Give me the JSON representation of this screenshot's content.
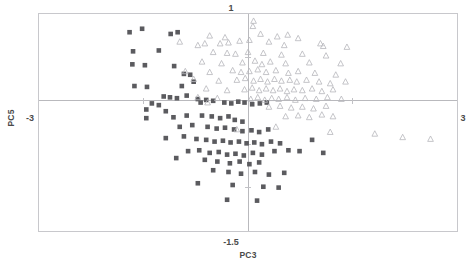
{
  "chart_data": {
    "type": "scatter",
    "title": "",
    "xlabel": "PC3",
    "ylabel": "PC5",
    "xlim": [
      -3,
      3
    ],
    "ylim": [
      -1.5,
      1
    ],
    "grid": false,
    "legend_position": "none",
    "xticks": [
      "-3",
      "3"
    ],
    "yticks": [
      "1",
      "-1.5"
    ],
    "axis_lines": {
      "x_at": 0,
      "y_at": 0
    },
    "series": [
      {
        "name": "group-1",
        "marker": "filled-square",
        "color": "#5b5b5f",
        "points": [
          [
            -1.7,
            0.79
          ],
          [
            -1.52,
            0.83
          ],
          [
            -1.11,
            0.77
          ],
          [
            -1.01,
            0.79
          ],
          [
            -1.65,
            0.57
          ],
          [
            -1.28,
            0.58
          ],
          [
            -1.66,
            0.42
          ],
          [
            -1.48,
            0.41
          ],
          [
            -1.06,
            0.4
          ],
          [
            -0.92,
            0.31
          ],
          [
            -0.83,
            0.3
          ],
          [
            -1.63,
            0.17
          ],
          [
            -1.45,
            0.16
          ],
          [
            -0.95,
            0.17
          ],
          [
            -0.78,
            0.22
          ],
          [
            -1.21,
            0.05
          ],
          [
            -1.12,
            0.04
          ],
          [
            -1.02,
            0.03
          ],
          [
            -0.88,
            0.06
          ],
          [
            -0.72,
            0.02
          ],
          [
            -0.6,
            0.01
          ],
          [
            -0.5,
            0.0
          ],
          [
            -1.38,
            -0.03
          ],
          [
            -1.28,
            -0.05
          ],
          [
            -0.68,
            -0.02
          ],
          [
            -0.34,
            -0.02
          ],
          [
            -0.24,
            -0.03
          ],
          [
            -0.14,
            -0.01
          ],
          [
            -0.05,
            -0.02
          ],
          [
            0.06,
            -0.04
          ],
          [
            0.17,
            -0.03
          ],
          [
            0.27,
            -0.02
          ],
          [
            -1.46,
            -0.1
          ],
          [
            -1.18,
            -0.12
          ],
          [
            -1.46,
            -0.2
          ],
          [
            -1.07,
            -0.19
          ],
          [
            -0.88,
            -0.17
          ],
          [
            -0.66,
            -0.17
          ],
          [
            -0.52,
            -0.18
          ],
          [
            -0.4,
            -0.2
          ],
          [
            -0.28,
            -0.18
          ],
          [
            -0.19,
            -0.22
          ],
          [
            -0.08,
            -0.24
          ],
          [
            -0.98,
            -0.3
          ],
          [
            -0.8,
            -0.28
          ],
          [
            -0.58,
            -0.3
          ],
          [
            -0.45,
            -0.32
          ],
          [
            -0.33,
            -0.31
          ],
          [
            -0.2,
            -0.33
          ],
          [
            -0.08,
            -0.35
          ],
          [
            0.05,
            -0.34
          ],
          [
            0.16,
            -0.36
          ],
          [
            0.29,
            -0.33
          ],
          [
            -1.18,
            -0.43
          ],
          [
            -0.92,
            -0.41
          ],
          [
            -0.74,
            -0.44
          ],
          [
            -0.6,
            -0.45
          ],
          [
            -0.48,
            -0.47
          ],
          [
            -0.36,
            -0.46
          ],
          [
            -0.25,
            -0.48
          ],
          [
            -0.13,
            -0.47
          ],
          [
            -0.02,
            -0.49
          ],
          [
            0.09,
            -0.48
          ],
          [
            0.2,
            -0.5
          ],
          [
            0.33,
            -0.47
          ],
          [
            0.46,
            -0.49
          ],
          [
            -0.86,
            -0.58
          ],
          [
            -0.7,
            -0.57
          ],
          [
            -0.55,
            -0.6
          ],
          [
            -0.42,
            -0.59
          ],
          [
            -0.3,
            -0.62
          ],
          [
            -0.18,
            -0.61
          ],
          [
            -0.06,
            -0.63
          ],
          [
            0.07,
            -0.6
          ],
          [
            0.2,
            -0.62
          ],
          [
            0.38,
            -0.58
          ],
          [
            0.58,
            -0.57
          ],
          [
            0.74,
            -0.58
          ],
          [
            -1.03,
            -0.66
          ],
          [
            -0.62,
            -0.68
          ],
          [
            -0.44,
            -0.7
          ],
          [
            -0.26,
            -0.72
          ],
          [
            -0.12,
            -0.7
          ],
          [
            0.02,
            -0.73
          ],
          [
            0.16,
            -0.71
          ],
          [
            -0.5,
            -0.8
          ],
          [
            -0.28,
            -0.82
          ],
          [
            -0.1,
            -0.84
          ],
          [
            0.1,
            -0.82
          ],
          [
            0.3,
            -0.85
          ],
          [
            0.52,
            -0.83
          ],
          [
            -0.72,
            -0.95
          ],
          [
            -0.22,
            -0.97
          ],
          [
            0.22,
            -0.99
          ],
          [
            0.44,
            -1.0
          ],
          [
            -0.3,
            -1.14
          ],
          [
            0.13,
            -1.15
          ],
          [
            1.08,
            -0.6
          ],
          [
            0.92,
            -0.45
          ]
        ]
      },
      {
        "name": "group-2",
        "marker": "open-triangle",
        "color": "#b6b6bb",
        "points": [
          [
            0.08,
            0.92
          ],
          [
            0.07,
            0.86
          ],
          [
            -0.55,
            0.75
          ],
          [
            -0.33,
            0.73
          ],
          [
            0.18,
            0.77
          ],
          [
            0.42,
            0.74
          ],
          [
            0.57,
            0.76
          ],
          [
            0.72,
            0.72
          ],
          [
            -0.98,
            0.68
          ],
          [
            -0.72,
            0.64
          ],
          [
            -0.62,
            0.66
          ],
          [
            -0.4,
            0.66
          ],
          [
            -0.28,
            0.67
          ],
          [
            -0.12,
            0.69
          ],
          [
            0.02,
            0.7
          ],
          [
            0.3,
            0.68
          ],
          [
            0.52,
            0.64
          ],
          [
            1.04,
            0.66
          ],
          [
            1.08,
            0.63
          ],
          [
            1.42,
            0.62
          ],
          [
            -0.5,
            0.56
          ],
          [
            -0.3,
            0.55
          ],
          [
            -0.18,
            0.54
          ],
          [
            0.0,
            0.56
          ],
          [
            0.22,
            0.55
          ],
          [
            0.48,
            0.53
          ],
          [
            0.78,
            0.54
          ],
          [
            1.12,
            0.52
          ],
          [
            -0.66,
            0.45
          ],
          [
            -0.38,
            0.43
          ],
          [
            -0.08,
            0.44
          ],
          [
            0.1,
            0.46
          ],
          [
            0.2,
            0.42
          ],
          [
            0.32,
            0.45
          ],
          [
            0.54,
            0.43
          ],
          [
            0.88,
            0.44
          ],
          [
            1.33,
            0.43
          ],
          [
            -0.9,
            0.34
          ],
          [
            -0.55,
            0.33
          ],
          [
            -0.22,
            0.35
          ],
          [
            -0.1,
            0.33
          ],
          [
            0.02,
            0.34
          ],
          [
            0.14,
            0.36
          ],
          [
            0.26,
            0.33
          ],
          [
            0.4,
            0.35
          ],
          [
            0.58,
            0.32
          ],
          [
            0.72,
            0.34
          ],
          [
            0.96,
            0.32
          ],
          [
            1.26,
            0.3
          ],
          [
            -0.78,
            0.25
          ],
          [
            -0.42,
            0.23
          ],
          [
            -0.16,
            0.24
          ],
          [
            -0.04,
            0.26
          ],
          [
            0.08,
            0.23
          ],
          [
            0.18,
            0.25
          ],
          [
            0.28,
            0.22
          ],
          [
            0.38,
            0.25
          ],
          [
            0.48,
            0.23
          ],
          [
            0.6,
            0.24
          ],
          [
            0.7,
            0.22
          ],
          [
            0.84,
            0.24
          ],
          [
            1.02,
            0.22
          ],
          [
            1.18,
            0.2
          ],
          [
            1.4,
            0.22
          ],
          [
            -0.6,
            0.14
          ],
          [
            -0.3,
            0.12
          ],
          [
            -0.05,
            0.13
          ],
          [
            0.06,
            0.15
          ],
          [
            0.16,
            0.12
          ],
          [
            0.26,
            0.14
          ],
          [
            0.36,
            0.12
          ],
          [
            0.46,
            0.14
          ],
          [
            0.56,
            0.11
          ],
          [
            0.66,
            0.13
          ],
          [
            0.78,
            0.12
          ],
          [
            0.92,
            0.14
          ],
          [
            1.06,
            0.11
          ],
          [
            1.22,
            0.13
          ],
          [
            -0.72,
            0.04
          ],
          [
            -0.44,
            0.03
          ],
          [
            0.04,
            0.02
          ],
          [
            0.14,
            0.04
          ],
          [
            0.24,
            0.01
          ],
          [
            0.34,
            0.03
          ],
          [
            0.44,
            0.02
          ],
          [
            0.56,
            0.04
          ],
          [
            0.68,
            0.01
          ],
          [
            0.82,
            0.03
          ],
          [
            0.98,
            0.02
          ],
          [
            1.14,
            0.04
          ],
          [
            1.34,
            0.02
          ],
          [
            0.3,
            -0.07
          ],
          [
            0.46,
            -0.06
          ],
          [
            0.62,
            -0.08
          ],
          [
            0.78,
            -0.07
          ],
          [
            0.94,
            -0.09
          ],
          [
            1.12,
            -0.06
          ],
          [
            0.54,
            -0.18
          ],
          [
            0.72,
            -0.17
          ],
          [
            0.88,
            -0.19
          ],
          [
            1.06,
            -0.16
          ],
          [
            1.22,
            -0.18
          ],
          [
            0.4,
            -0.3
          ],
          [
            1.18,
            -0.36
          ],
          [
            1.82,
            -0.38
          ],
          [
            2.22,
            -0.42
          ],
          [
            2.62,
            -0.44
          ],
          [
            -0.58,
            -0.02
          ],
          [
            -0.16,
            -0.33
          ]
        ]
      }
    ]
  }
}
